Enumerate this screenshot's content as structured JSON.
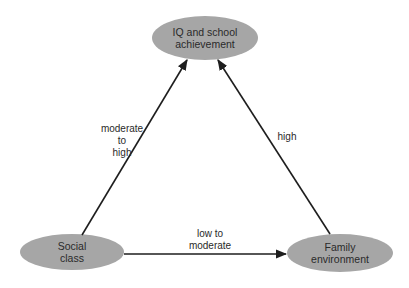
{
  "diagram": {
    "type": "triangle-relationship",
    "colors": {
      "node_fill": "#a6a6a6",
      "edge_stroke": "#1e1e1e",
      "text": "#2a2a2a",
      "background": "#ffffff"
    },
    "nodes": [
      {
        "id": "iq",
        "lines": [
          "IQ and school",
          "achievement"
        ]
      },
      {
        "id": "social",
        "lines": [
          "Social",
          "class"
        ]
      },
      {
        "id": "family",
        "lines": [
          "Family",
          "environment"
        ]
      }
    ],
    "edges": [
      {
        "from": "social",
        "to": "iq",
        "label_lines": [
          "moderate",
          "to",
          "high"
        ]
      },
      {
        "from": "family",
        "to": "iq",
        "label_lines": [
          "high"
        ]
      },
      {
        "from": "social",
        "to": "family",
        "label_lines": [
          "low to",
          "moderate"
        ]
      }
    ]
  }
}
